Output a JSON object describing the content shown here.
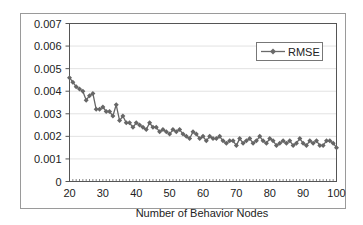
{
  "chart_data": {
    "type": "line",
    "title": "",
    "xlabel": "Number of Behavior Nodes",
    "ylabel": "",
    "xlim": [
      20,
      100
    ],
    "ylim": [
      0,
      0.007
    ],
    "x_ticks": [
      "20",
      "30",
      "40",
      "50",
      "60",
      "70",
      "80",
      "90",
      "100"
    ],
    "y_ticks": [
      "0",
      "0.001",
      "0.002",
      "0.003",
      "0.004",
      "0.005",
      "0.006",
      "0.007"
    ],
    "grid": "horizontal",
    "legend_position": "upper-right",
    "series": [
      {
        "name": "RMSE",
        "color": "#666666",
        "marker": "diamond",
        "x": [
          20,
          21,
          22,
          23,
          24,
          25,
          26,
          27,
          28,
          29,
          30,
          31,
          32,
          33,
          34,
          35,
          36,
          37,
          38,
          39,
          40,
          41,
          42,
          43,
          44,
          45,
          46,
          47,
          48,
          49,
          50,
          51,
          52,
          53,
          54,
          55,
          56,
          57,
          58,
          59,
          60,
          61,
          62,
          63,
          64,
          65,
          66,
          67,
          68,
          69,
          70,
          71,
          72,
          73,
          74,
          75,
          76,
          77,
          78,
          79,
          80,
          81,
          82,
          83,
          84,
          85,
          86,
          87,
          88,
          89,
          90,
          91,
          92,
          93,
          94,
          95,
          96,
          97,
          98,
          99,
          100
        ],
        "values": [
          0.0046,
          0.0044,
          0.0042,
          0.0041,
          0.004,
          0.0036,
          0.0038,
          0.0039,
          0.0032,
          0.0032,
          0.0033,
          0.0031,
          0.0031,
          0.0029,
          0.0034,
          0.0027,
          0.0029,
          0.0026,
          0.0026,
          0.0024,
          0.0026,
          0.0025,
          0.0024,
          0.0023,
          0.0026,
          0.0024,
          0.0024,
          0.0022,
          0.0023,
          0.0022,
          0.0021,
          0.0023,
          0.0022,
          0.0023,
          0.0021,
          0.002,
          0.0019,
          0.0022,
          0.0021,
          0.0019,
          0.002,
          0.0018,
          0.002,
          0.0019,
          0.0019,
          0.002,
          0.0018,
          0.0017,
          0.0018,
          0.0018,
          0.0016,
          0.0019,
          0.0017,
          0.0018,
          0.0019,
          0.0017,
          0.0018,
          0.002,
          0.0018,
          0.0017,
          0.0019,
          0.0018,
          0.0016,
          0.0017,
          0.0018,
          0.0017,
          0.0018,
          0.0016,
          0.0017,
          0.0019,
          0.0017,
          0.0016,
          0.0018,
          0.0017,
          0.0018,
          0.0016,
          0.0016,
          0.0018,
          0.0018,
          0.0017,
          0.0015
        ]
      }
    ]
  }
}
